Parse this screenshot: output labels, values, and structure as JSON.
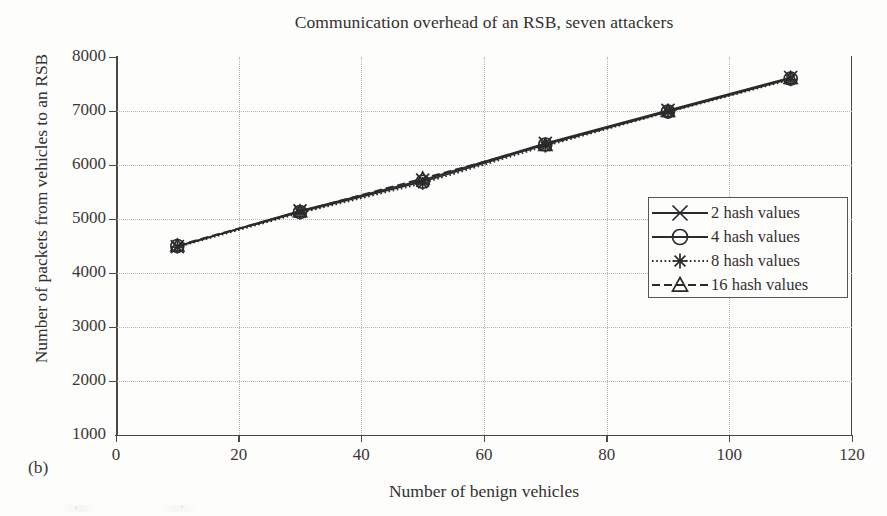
{
  "figure": {
    "subfigure_label": "(b)",
    "background_color": "#fdfdfc",
    "axis_color": "#4a4846",
    "grid_color": "#b9b7b4",
    "series_color": "#2b2b2b"
  },
  "chart_data": {
    "type": "line",
    "title": "Communication overhead of an RSB, seven attackers",
    "xlabel": "Number of benign vehicles",
    "ylabel": "Number of packets from vehicles to an RSB",
    "x": [
      10,
      30,
      50,
      70,
      90,
      110
    ],
    "xlim": [
      0,
      120
    ],
    "ylim": [
      1000,
      8000
    ],
    "xticks": [
      0,
      20,
      40,
      60,
      80,
      100,
      120
    ],
    "yticks": [
      1000,
      2000,
      3000,
      4000,
      5000,
      6000,
      7000,
      8000
    ],
    "xtick_labels": [
      "0",
      "20",
      "40",
      "60",
      "80",
      "100",
      "120"
    ],
    "ytick_labels": [
      "1000",
      "2000",
      "3000",
      "4000",
      "5000",
      "6000",
      "7000",
      "8000"
    ],
    "grid": true,
    "grid_style": "dotted",
    "legend_position": "center right",
    "series": [
      {
        "name": "2 hash values",
        "marker": "x-cross",
        "linestyle": "solid",
        "values": [
          4490,
          5150,
          5720,
          6400,
          7010,
          7620
        ]
      },
      {
        "name": "4 hash values",
        "marker": "circle",
        "linestyle": "solid",
        "values": [
          4500,
          5130,
          5690,
          6380,
          6990,
          7600
        ]
      },
      {
        "name": "8 hash values",
        "marker": "asterisk",
        "linestyle": "dotted",
        "values": [
          4480,
          5110,
          5660,
          6350,
          6980,
          7580
        ]
      },
      {
        "name": "16 hash values",
        "marker": "triangle",
        "linestyle": "dashed",
        "values": [
          4510,
          5140,
          5750,
          6370,
          7000,
          7610
        ]
      }
    ]
  }
}
